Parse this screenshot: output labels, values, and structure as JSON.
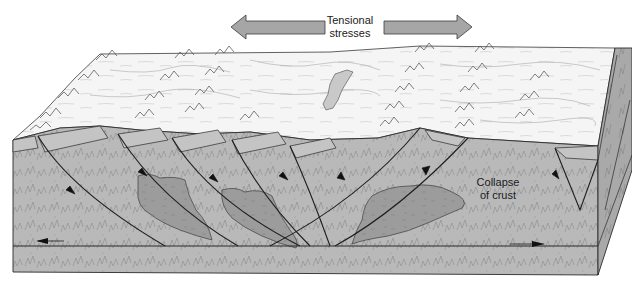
{
  "figure": {
    "type": "geologic-block-diagram"
  },
  "labels": {
    "tension_line1": "Tensional",
    "tension_line2": "stresses",
    "collapse_line1": "Collapse",
    "collapse_line2": "of crust"
  },
  "arrows": {
    "stress_left": "left-pointing stress arrow",
    "stress_right": "right-pointing stress arrow",
    "basal_left": "basal slip arrow (left)",
    "basal_right": "basal slip arrow (right)"
  },
  "colors": {
    "surface": "#f4f4f4",
    "crust": "#b9b9b9",
    "crust_dark": "#a8a8a8",
    "magma_body": "#9a9a9a",
    "side_face": "#a9a9a9",
    "arrow_fill": "#a6a6a6",
    "line": "#2a2a2a",
    "lake": "#c9c9c9"
  },
  "faults": [
    {
      "id": 1,
      "dip": "down-right"
    },
    {
      "id": 2,
      "dip": "down-right"
    },
    {
      "id": 3,
      "dip": "down-right"
    },
    {
      "id": 4,
      "dip": "down-right"
    },
    {
      "id": 5,
      "dip": "down-right"
    },
    {
      "id": 6,
      "dip": "down-left"
    },
    {
      "id": 7,
      "dip": "down-left"
    }
  ]
}
